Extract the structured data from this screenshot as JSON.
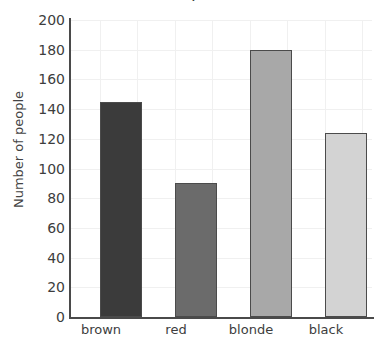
{
  "chart_data": {
    "type": "bar",
    "title": "",
    "xlabel": "",
    "ylabel": "Number of people",
    "categories": [
      "brown",
      "red",
      "blonde",
      "black"
    ],
    "values": [
      145,
      90,
      180,
      124
    ],
    "ylim": [
      0,
      200
    ],
    "yticks": [
      0,
      20,
      40,
      60,
      80,
      100,
      120,
      140,
      160,
      180,
      200
    ],
    "ytick_labels": [
      "0",
      "20",
      "40",
      "60",
      "80",
      "100",
      "120",
      "140",
      "160",
      "180",
      "200"
    ],
    "grid": true,
    "legend": "none",
    "bar_colors": [
      "#3b3b3b",
      "#6b6b6b",
      "#a8a8a8",
      "#d3d3d3"
    ],
    "bar_edge_color": "#4b4b4b",
    "grid_color": "#f0f0f0",
    "axis_color": "#4a4a4a",
    "text_color": "#3d3d3d"
  },
  "axes": {
    "y_title": "Number of people",
    "y_labels": {
      "t0": "0",
      "t20": "20",
      "t40": "40",
      "t60": "60",
      "t80": "80",
      "t100": "100",
      "t120": "120",
      "t140": "140",
      "t160": "160",
      "t180": "180",
      "t200": "200"
    },
    "x_labels": {
      "c0": "brown",
      "c1": "red",
      "c2": "blonde",
      "c3": "black"
    }
  },
  "title_fragment": "."
}
